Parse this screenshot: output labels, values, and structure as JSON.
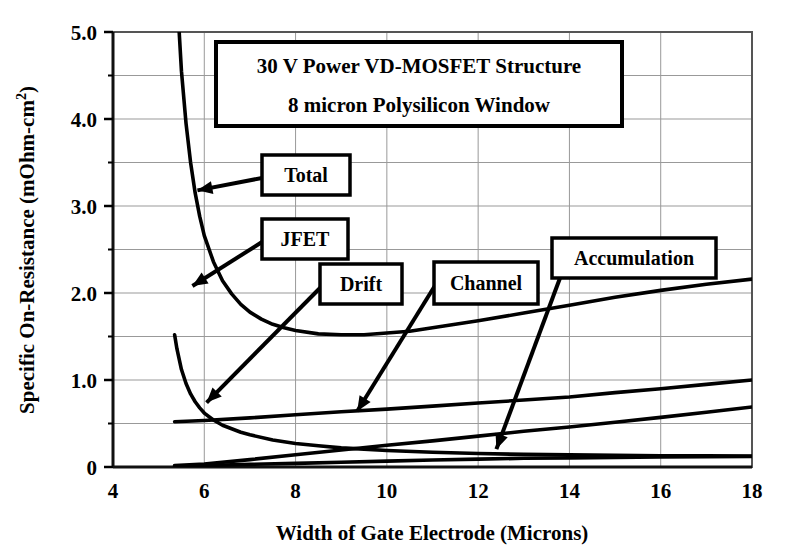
{
  "chart_data": {
    "type": "line",
    "title": "30 V Power VD-MOSFET Structure",
    "subtitle": "8 micron Polysilicon Window",
    "xlabel": "Width of Gate Electrode   (Microns)",
    "ylabel_main": "Specific On-Resistance  (mOhm-cm",
    "ylabel_sup": "2",
    "ylabel_close": ")",
    "xlim": [
      4,
      18
    ],
    "ylim": [
      0,
      5.0
    ],
    "xticks": [
      4,
      6,
      8,
      10,
      12,
      14,
      16,
      18
    ],
    "xtick_labels": [
      "4",
      "6",
      "8",
      "10",
      "12",
      "14",
      "16",
      "18"
    ],
    "yticks": [
      0,
      1.0,
      2.0,
      3.0,
      4.0,
      5.0
    ],
    "ytick_labels": [
      "0",
      "1.0",
      "2.0",
      "3.0",
      "4.0",
      "5.0"
    ],
    "y_minor_ticks": [
      0.5,
      1.5,
      2.5,
      3.5,
      4.5
    ],
    "grid": true,
    "grid_color": "#999999",
    "legend": "none",
    "line_color": "#000000",
    "series": [
      {
        "name": "Total",
        "x": [
          5.45,
          5.5,
          5.6,
          5.7,
          5.8,
          5.9,
          6.0,
          6.2,
          6.4,
          6.6,
          6.8,
          7.0,
          7.25,
          7.5,
          7.75,
          8.0,
          8.5,
          9.0,
          9.5,
          10.0,
          10.5,
          11.0,
          11.5,
          12.0,
          13.0,
          14.0,
          15.0,
          16.0,
          17.0,
          18.0
        ],
        "y": [
          5.0,
          4.55,
          3.95,
          3.5,
          3.15,
          2.88,
          2.66,
          2.36,
          2.14,
          1.99,
          1.87,
          1.78,
          1.7,
          1.64,
          1.6,
          1.57,
          1.53,
          1.52,
          1.52,
          1.54,
          1.56,
          1.6,
          1.64,
          1.68,
          1.77,
          1.86,
          1.95,
          2.03,
          2.1,
          2.16
        ]
      },
      {
        "name": "JFET",
        "x": [
          5.35,
          5.4,
          5.5,
          5.6,
          5.7,
          5.8,
          5.9,
          6.0,
          6.2,
          6.4,
          6.6,
          6.8,
          7.0,
          7.5,
          8.0,
          8.5,
          9.0,
          9.5,
          10.0,
          11.0,
          12.0,
          13.0,
          14.0,
          15.0,
          16.0,
          17.0,
          18.0
        ],
        "y": [
          1.52,
          1.36,
          1.12,
          0.96,
          0.84,
          0.75,
          0.68,
          0.62,
          0.54,
          0.48,
          0.44,
          0.4,
          0.37,
          0.31,
          0.27,
          0.245,
          0.22,
          0.205,
          0.19,
          0.17,
          0.155,
          0.145,
          0.14,
          0.135,
          0.13,
          0.128,
          0.125
        ]
      },
      {
        "name": "Drift",
        "x": [
          5.35,
          6.0,
          7.0,
          8.0,
          9.0,
          10.0,
          11.0,
          12.0,
          13.0,
          14.0,
          15.0,
          16.0,
          17.0,
          18.0
        ],
        "y": [
          0.52,
          0.535,
          0.565,
          0.6,
          0.635,
          0.665,
          0.7,
          0.735,
          0.77,
          0.805,
          0.855,
          0.9,
          0.95,
          1.0
        ]
      },
      {
        "name": "Channel",
        "x": [
          5.35,
          6.0,
          7.0,
          8.0,
          9.0,
          10.0,
          11.0,
          12.0,
          13.0,
          14.0,
          15.0,
          16.0,
          17.0,
          18.0
        ],
        "y": [
          0.018,
          0.035,
          0.085,
          0.14,
          0.195,
          0.25,
          0.3,
          0.355,
          0.41,
          0.46,
          0.515,
          0.57,
          0.63,
          0.69
        ]
      },
      {
        "name": "Accumulation",
        "x": [
          5.35,
          6.0,
          7.0,
          8.0,
          9.0,
          10.0,
          11.0,
          12.0,
          13.0,
          14.0,
          15.0,
          16.0,
          17.0,
          18.0
        ],
        "y": [
          0.012,
          0.018,
          0.03,
          0.042,
          0.055,
          0.068,
          0.08,
          0.09,
          0.1,
          0.105,
          0.11,
          0.115,
          0.118,
          0.12
        ]
      }
    ],
    "annotations": [
      {
        "label": "Total",
        "target_x": 5.85,
        "target_y": 3.18
      },
      {
        "label": "JFET",
        "target_x": 5.74,
        "target_y": 2.08
      },
      {
        "label": "Drift",
        "target_x": 6.05,
        "target_y": 0.74
      },
      {
        "label": "Channel",
        "target_x": 9.35,
        "target_y": 0.64
      },
      {
        "label": "Accumulation",
        "target_x": 12.4,
        "target_y": 0.205
      }
    ]
  }
}
